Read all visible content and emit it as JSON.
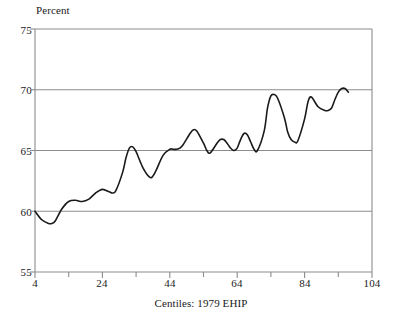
{
  "chart_data": {
    "type": "line",
    "title": "",
    "subtitle": "",
    "xlabel": "Centiles: 1979 EHIP",
    "ylabel": "Percent",
    "ylabel_position": "top-left",
    "xlim": [
      4,
      104
    ],
    "ylim": [
      55,
      75
    ],
    "grid": "horizontal",
    "legend": "none",
    "x_ticks": [
      4,
      24,
      44,
      64,
      84,
      104
    ],
    "x_tick_labels": [
      "4",
      "24",
      "44",
      "64",
      "84",
      "104"
    ],
    "x_minor_ticks": [
      14,
      34,
      54,
      74,
      94
    ],
    "y_ticks": [
      55,
      60,
      65,
      70,
      75
    ],
    "y_tick_labels": [
      "55",
      "60",
      "65",
      "70",
      "75"
    ],
    "line_color": "#1a1a1a",
    "grid_color": "#8c8c8c",
    "axis_color": "#8c8c8c",
    "background_color": "#ffffff",
    "series": [
      {
        "name": "Percent",
        "x": [
          4,
          6,
          8,
          9,
          10,
          12,
          14,
          16,
          18,
          20,
          22,
          24,
          26,
          27,
          28,
          30,
          31,
          32,
          33,
          34,
          36,
          38,
          39,
          40,
          42,
          44,
          45,
          46,
          47,
          48,
          50,
          51,
          52,
          54,
          55,
          56,
          58,
          59,
          60,
          61,
          62,
          63,
          64,
          65,
          66,
          67,
          68,
          69,
          70,
          72,
          73,
          74,
          75,
          76,
          78,
          79,
          80,
          81,
          82,
          84,
          85,
          86,
          88,
          90,
          91,
          92,
          93,
          94,
          95,
          96,
          97
        ],
        "y": [
          60.0,
          59.3,
          59.0,
          59.0,
          59.2,
          60.2,
          60.8,
          60.9,
          60.8,
          61.0,
          61.5,
          61.8,
          61.6,
          61.5,
          61.7,
          63.2,
          64.4,
          65.2,
          65.3,
          64.9,
          63.6,
          62.8,
          62.9,
          63.4,
          64.6,
          65.1,
          65.1,
          65.1,
          65.2,
          65.5,
          66.4,
          66.7,
          66.6,
          65.6,
          65.0,
          64.8,
          65.6,
          65.9,
          65.9,
          65.6,
          65.2,
          65.0,
          65.2,
          65.9,
          66.4,
          66.3,
          65.7,
          65.1,
          65.0,
          66.6,
          68.5,
          69.5,
          69.6,
          69.3,
          67.7,
          66.5,
          65.9,
          65.7,
          65.8,
          67.6,
          69.0,
          69.4,
          68.6,
          68.3,
          68.3,
          68.5,
          69.2,
          69.8,
          70.1,
          70.1,
          69.8
        ]
      }
    ]
  }
}
